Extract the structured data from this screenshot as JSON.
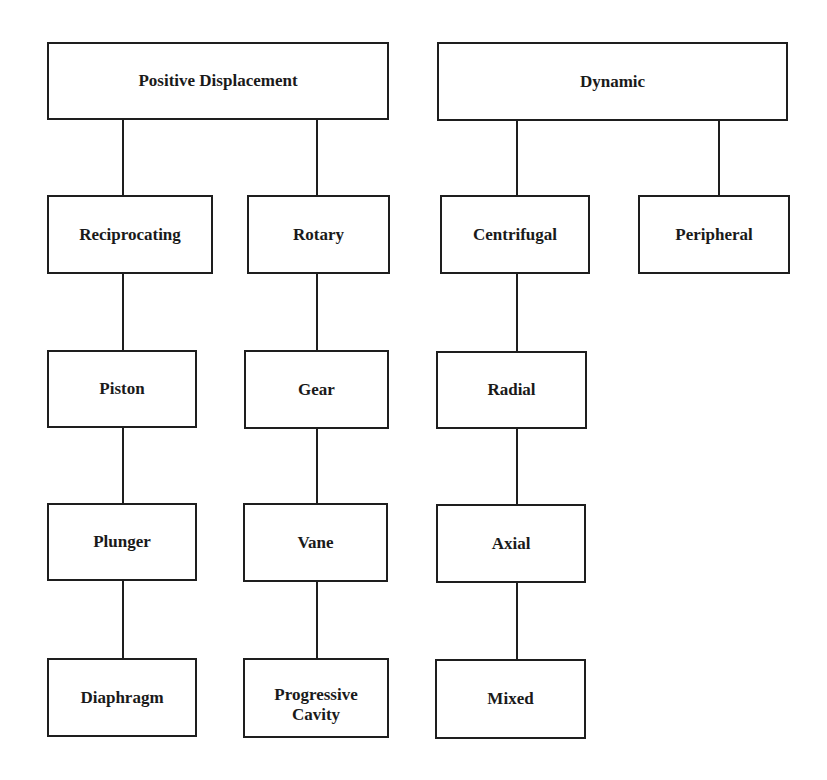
{
  "diagram": {
    "categories": [
      {
        "label": "Positive Displacement",
        "children": [
          {
            "label": "Reciprocating",
            "children": [
              "Piston",
              "Plunger",
              "Diaphragm"
            ]
          },
          {
            "label": "Rotary",
            "children": [
              "Gear",
              "Vane",
              "Progressive\nCavity"
            ]
          }
        ]
      },
      {
        "label": "Dynamic",
        "children": [
          {
            "label": "Centrifugal",
            "children": [
              "Radial",
              "Axial",
              "Mixed"
            ]
          },
          {
            "label": "Peripheral",
            "children": []
          }
        ]
      }
    ]
  },
  "colors": {
    "line": "#1e1e1e",
    "background": "#ffffff",
    "text": "#1a1a1a"
  }
}
